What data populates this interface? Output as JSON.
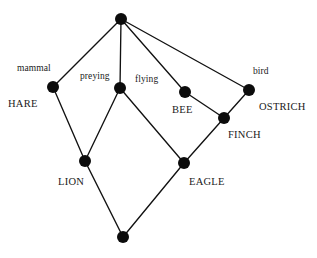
{
  "figure": {
    "type": "concept-lattice-hasse-diagram",
    "width": 317,
    "height": 258,
    "background_color": "#ffffff",
    "node_color": "#0c0c0c",
    "edge_color": "#111111",
    "node_radius": 6
  },
  "nodes": [
    {
      "id": "top",
      "x": 121,
      "y": 19,
      "attribute_label": "",
      "object_label": ""
    },
    {
      "id": "hare",
      "x": 53,
      "y": 87,
      "attribute_label": "mammal",
      "object_label": "HARE"
    },
    {
      "id": "preying",
      "x": 120,
      "y": 88,
      "attribute_label": "preying",
      "object_label": ""
    },
    {
      "id": "bee",
      "x": 185,
      "y": 92,
      "attribute_label": "flying",
      "object_label": "BEE"
    },
    {
      "id": "ostrich",
      "x": 249,
      "y": 90,
      "attribute_label": "bird",
      "object_label": "OSTRICH"
    },
    {
      "id": "finch",
      "x": 224,
      "y": 118,
      "attribute_label": "",
      "object_label": "FINCH"
    },
    {
      "id": "lion",
      "x": 85,
      "y": 161,
      "attribute_label": "",
      "object_label": "LION"
    },
    {
      "id": "eagle",
      "x": 184,
      "y": 163,
      "attribute_label": "",
      "object_label": "EAGLE"
    },
    {
      "id": "bottom",
      "x": 123,
      "y": 237,
      "attribute_label": "",
      "object_label": ""
    }
  ],
  "edges": [
    {
      "from": "top",
      "to": "hare"
    },
    {
      "from": "top",
      "to": "preying"
    },
    {
      "from": "top",
      "to": "bee"
    },
    {
      "from": "top",
      "to": "ostrich"
    },
    {
      "from": "hare",
      "to": "lion"
    },
    {
      "from": "preying",
      "to": "lion"
    },
    {
      "from": "preying",
      "to": "eagle"
    },
    {
      "from": "bee",
      "to": "finch"
    },
    {
      "from": "ostrich",
      "to": "finch"
    },
    {
      "from": "finch",
      "to": "eagle"
    },
    {
      "from": "lion",
      "to": "bottom"
    },
    {
      "from": "eagle",
      "to": "bottom"
    }
  ],
  "labels": [
    {
      "key": "mammal",
      "text": "mammal",
      "kind": "attribute",
      "x": 17,
      "y": 64
    },
    {
      "key": "preying",
      "text": "preying",
      "kind": "attribute",
      "x": 80,
      "y": 72
    },
    {
      "key": "flying",
      "text": "flying",
      "kind": "attribute",
      "x": 135,
      "y": 75
    },
    {
      "key": "bird",
      "text": "bird",
      "kind": "attribute",
      "x": 253,
      "y": 67
    },
    {
      "key": "hare",
      "text": "HARE",
      "kind": "object",
      "x": 8,
      "y": 99
    },
    {
      "key": "bee",
      "text": "BEE",
      "kind": "object",
      "x": 172,
      "y": 105
    },
    {
      "key": "ostrich",
      "text": "OSTRICH",
      "kind": "object",
      "x": 259,
      "y": 102
    },
    {
      "key": "finch",
      "text": "FINCH",
      "kind": "object",
      "x": 228,
      "y": 130
    },
    {
      "key": "lion",
      "text": "LION",
      "kind": "object",
      "x": 58,
      "y": 177
    },
    {
      "key": "eagle",
      "text": "EAGLE",
      "kind": "object",
      "x": 189,
      "y": 177
    }
  ]
}
